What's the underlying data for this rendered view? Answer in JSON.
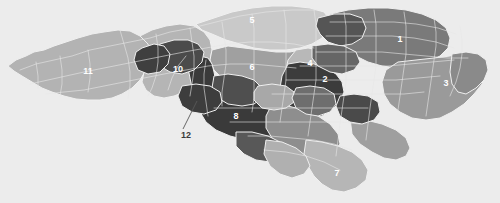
{
  "figure": {
    "kind": "choropleth-map",
    "background_color": "#ececec",
    "width": 500,
    "height": 203,
    "border_color": "#efefef",
    "county_line_color": "#e8e8e8"
  },
  "palette": {
    "very_dark": "#3a3a3a",
    "dark": "#4d4d4d",
    "medium_dark": "#7a7a7a",
    "medium": "#8f8f8f",
    "medium_light": "#9e9e9e",
    "light": "#b4b4b4",
    "very_light": "#c9c9c9",
    "pale": "#d6d6d6"
  },
  "districts": [
    {
      "id": "d1",
      "label": "1",
      "x": 400,
      "y": 40,
      "fill": "#7a7a7a",
      "label_color": "light"
    },
    {
      "id": "d2",
      "label": "2",
      "x": 325,
      "y": 80,
      "fill": "#3a3a3a",
      "label_color": "light"
    },
    {
      "id": "d3",
      "label": "3",
      "x": 446,
      "y": 84,
      "fill": "#9a9a9a",
      "label_color": "light"
    },
    {
      "id": "d4",
      "label": "4",
      "x": 310,
      "y": 64,
      "fill": "#b4b4b4",
      "label_color": "light"
    },
    {
      "id": "d5",
      "label": "5",
      "x": 252,
      "y": 21,
      "fill": "#c9c9c9",
      "label_color": "light"
    },
    {
      "id": "d6",
      "label": "6",
      "x": 252,
      "y": 68,
      "fill": "#9e9e9e",
      "label_color": "light"
    },
    {
      "id": "d7",
      "label": "7",
      "x": 337,
      "y": 174,
      "fill": "#b4b4b4",
      "label_color": "light"
    },
    {
      "id": "d8",
      "label": "8",
      "x": 236,
      "y": 117,
      "fill": "#3a3a3a",
      "label_color": "light"
    },
    {
      "id": "d10",
      "label": "10",
      "x": 178,
      "y": 70,
      "fill": "#b4b4b4",
      "label_color": "light"
    },
    {
      "id": "d11",
      "label": "11",
      "x": 88,
      "y": 72,
      "fill": "#b4b4b4",
      "label_color": "light"
    }
  ],
  "callouts": [
    {
      "id": "c12",
      "label": "12",
      "label_x": 186,
      "label_y": 136,
      "leader_from_x": 183,
      "leader_from_y": 129,
      "leader_to_x": 197,
      "leader_to_y": 101,
      "color": "#585858"
    }
  ]
}
